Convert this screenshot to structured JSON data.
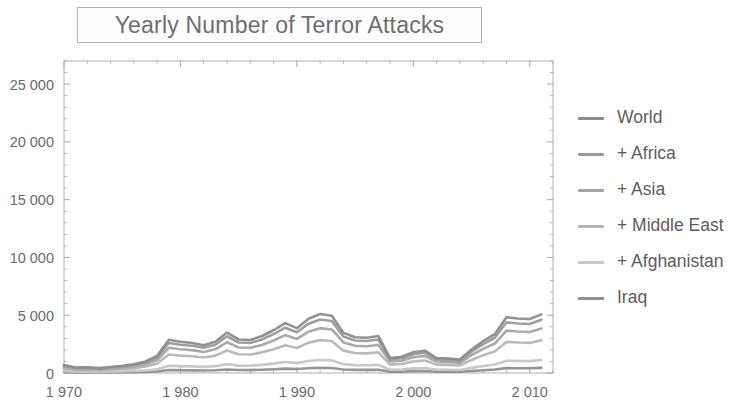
{
  "chart_data": {
    "type": "line",
    "title": "Yearly Number of Terror Attacks",
    "xlabel": "",
    "ylabel": "",
    "xlim": [
      1970,
      2012
    ],
    "ylim": [
      0,
      27000
    ],
    "grid": false,
    "legend_position": "right",
    "x_tick_labels": [
      "1 970",
      "1 980",
      "1 990",
      "2 000",
      "2 010"
    ],
    "x_ticks": [
      1970,
      1980,
      1990,
      2000,
      2010
    ],
    "x_minor_tick_step": 2,
    "y_tick_labels": [
      "0",
      "5 000",
      "10 000",
      "15 000",
      "20 000",
      "25 000"
    ],
    "y_ticks": [
      0,
      5000,
      10000,
      15000,
      20000,
      25000
    ],
    "y_minor_tick_step": 1000,
    "x": [
      1970,
      1971,
      1972,
      1973,
      1974,
      1975,
      1976,
      1977,
      1978,
      1979,
      1980,
      1981,
      1982,
      1983,
      1984,
      1985,
      1986,
      1987,
      1988,
      1989,
      1990,
      1991,
      1992,
      1993,
      1994,
      1995,
      1996,
      1997,
      1998,
      1999,
      2000,
      2001,
      2002,
      2003,
      2004,
      2005,
      2006,
      2007,
      2008,
      2009,
      2010,
      2011
    ],
    "series": [
      {
        "name": "World",
        "color": "#8c8c8c",
        "values": [
          700,
          480,
          500,
          420,
          520,
          620,
          760,
          1000,
          1480,
          2880,
          2700,
          2600,
          2400,
          2700,
          3500,
          2900,
          2860,
          3200,
          3700,
          4320,
          3880,
          4700,
          5100,
          4960,
          3470,
          3100,
          3050,
          3200,
          1300,
          1400,
          1800,
          1930,
          1300,
          1260,
          1160,
          2030,
          2760,
          3360,
          4820,
          4720,
          4670,
          5076
        ],
        "note": "topmost stacked total curve"
      },
      {
        "name": "+ Africa",
        "color": "#9a9a9a",
        "values": [
          620,
          430,
          450,
          380,
          470,
          560,
          690,
          910,
          1340,
          2600,
          2450,
          2360,
          2180,
          2450,
          3180,
          2640,
          2600,
          2900,
          3360,
          3920,
          3520,
          4270,
          4630,
          4500,
          3150,
          2810,
          2770,
          2900,
          1180,
          1270,
          1630,
          1750,
          1180,
          1140,
          1050,
          1840,
          2500,
          3050,
          4380,
          4290,
          4240,
          4610
        ]
      },
      {
        "name": "+ Asia",
        "color": "#a5a5a5",
        "values": [
          520,
          360,
          380,
          320,
          395,
          470,
          580,
          760,
          1120,
          2180,
          2050,
          1980,
          1820,
          2050,
          2660,
          2210,
          2180,
          2430,
          2810,
          3280,
          2950,
          3580,
          3880,
          3770,
          2640,
          2350,
          2320,
          2430,
          990,
          1060,
          1370,
          1470,
          990,
          955,
          880,
          1540,
          2090,
          2550,
          3670,
          3590,
          3550,
          3860
        ]
      },
      {
        "name": "+ Middle East",
        "color": "#b6b6b6",
        "values": [
          380,
          265,
          280,
          235,
          290,
          345,
          425,
          560,
          820,
          1600,
          1505,
          1450,
          1335,
          1505,
          1950,
          1620,
          1600,
          1785,
          2060,
          2405,
          2165,
          2625,
          2845,
          2765,
          1935,
          1725,
          1700,
          1785,
          725,
          780,
          1005,
          1080,
          725,
          700,
          645,
          1130,
          1535,
          1870,
          2690,
          2635,
          2605,
          2830
        ]
      },
      {
        "name": "+ Afghanistan",
        "color": "#c6c6c6",
        "values": [
          150,
          105,
          110,
          93,
          115,
          136,
          168,
          221,
          324,
          632,
          594,
          573,
          527,
          594,
          770,
          640,
          632,
          705,
          814,
          950,
          855,
          1037,
          1124,
          1092,
          764,
          681,
          672,
          705,
          286,
          308,
          397,
          426,
          286,
          276,
          255,
          446,
          606,
          739,
          1063,
          1041,
          1029,
          1118
        ]
      },
      {
        "name": "Iraq",
        "color": "#8f8f8f",
        "values": [
          60,
          42,
          44,
          37,
          46,
          54,
          67,
          88,
          130,
          253,
          238,
          229,
          211,
          238,
          308,
          256,
          253,
          282,
          326,
          380,
          342,
          415,
          450,
          437,
          306,
          272,
          269,
          282,
          114,
          123,
          159,
          170,
          114,
          110,
          102,
          178,
          242,
          296,
          425,
          416,
          412,
          447
        ]
      }
    ]
  },
  "title": {
    "text": "Yearly Number of Terror Attacks"
  },
  "legend": {
    "items": [
      {
        "label": "World",
        "color": "#8c8c8c",
        "swatch_name": "legend-swatch-world"
      },
      {
        "label": "+ Africa",
        "color": "#9a9a9a",
        "swatch_name": "legend-swatch-africa"
      },
      {
        "label": "+ Asia",
        "color": "#a5a5a5",
        "swatch_name": "legend-swatch-asia"
      },
      {
        "label": "+ Middle East",
        "color": "#b6b6b6",
        "swatch_name": "legend-swatch-middle-east"
      },
      {
        "label": "+ Afghanistan",
        "color": "#c6c6c6",
        "swatch_name": "legend-swatch-afghanistan"
      },
      {
        "label": "Iraq",
        "color": "#8f8f8f",
        "swatch_name": "legend-swatch-iraq"
      }
    ]
  },
  "axes": {
    "x_labels": [
      "1 970",
      "1 980",
      "1 990",
      "2 000",
      "2 010"
    ],
    "y_labels": [
      "0",
      "5 000",
      "10 000",
      "15 000",
      "20 000",
      "25 000"
    ]
  },
  "style": {
    "frame_color": "#b0b0b0",
    "tick_color": "#a8a8a8",
    "text_color": "#6b6b6b",
    "background": "#ffffff"
  }
}
